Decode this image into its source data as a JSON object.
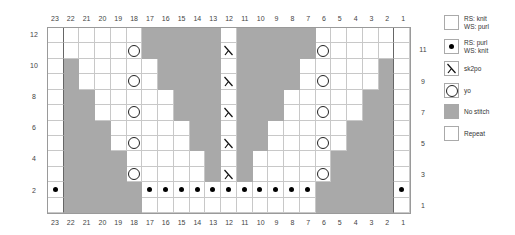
{
  "chart_data": {
    "type": "knitting-chart",
    "columns": 23,
    "rows": 12,
    "column_labels": [
      "23",
      "22",
      "21",
      "20",
      "19",
      "18",
      "17",
      "16",
      "15",
      "14",
      "13",
      "12",
      "11",
      "10",
      "9",
      "8",
      "7",
      "6",
      "5",
      "4",
      "3",
      "2",
      "1"
    ],
    "left_row_labels": [
      "12",
      "10",
      "8",
      "6",
      "4",
      "2"
    ],
    "right_row_labels": [
      "11",
      "9",
      "7",
      "5",
      "3",
      "1"
    ],
    "repeat_columns": [
      22,
      2
    ],
    "grid_rows_top_to_bottom": [
      {
        "row": 12,
        "cells": "KKKKKKNNNNNKNNNNNKKKKKK"
      },
      {
        "row": 11,
        "cells": "KKKKKONNNNNSNNNNNOKKKKK"
      },
      {
        "row": 10,
        "cells": "KNKKKKKNNNNKNNNNKKKKKNK"
      },
      {
        "row": 9,
        "cells": "KNKKKOKNNNNSNNNNKOKKKNK"
      },
      {
        "row": 8,
        "cells": "KNNKKKKKNNNKNNNKKKKKNNK"
      },
      {
        "row": 7,
        "cells": "KNNKKOKKNNNSNNNKKOKKNNK"
      },
      {
        "row": 6,
        "cells": "KNNNKKKKKNNKNNKKKKKNNNK"
      },
      {
        "row": 5,
        "cells": "KNNNKOKKKNNSNNKKKOKNNNK"
      },
      {
        "row": 4,
        "cells": "KNNNNKKKKKNKNKKKKKNNNNK"
      },
      {
        "row": 3,
        "cells": "KNNNNOKKKKNSNKKKKONNNNK"
      },
      {
        "row": 2,
        "cells": "PNNNNNPPPPPPPPPPPNNNNNP"
      },
      {
        "row": 1,
        "cells": "KNNNNNKKKKKKKKKKKNNNNNK"
      }
    ],
    "cell_codes": {
      "K": "knit",
      "P": "purl",
      "O": "yo",
      "S": "sk2po",
      "N": "no stitch"
    }
  },
  "legend": [
    {
      "symbol": "knit-icon",
      "line1": "RS: knit",
      "line2": "WS: purl"
    },
    {
      "symbol": "purl-icon",
      "line1": "RS: purl",
      "line2": "WS: knit"
    },
    {
      "symbol": "sk2po-icon",
      "line1": "sk2po",
      "line2": ""
    },
    {
      "symbol": "yo-icon",
      "line1": "yo",
      "line2": ""
    },
    {
      "symbol": "no-stitch-icon",
      "line1": "No stitch",
      "line2": ""
    },
    {
      "symbol": "repeat-icon",
      "line1": "Repeat",
      "line2": ""
    }
  ],
  "colors": {
    "no_stitch": "#a9a9a9",
    "grid_line": "#c8c8c8",
    "border": "#9a9a9a"
  }
}
